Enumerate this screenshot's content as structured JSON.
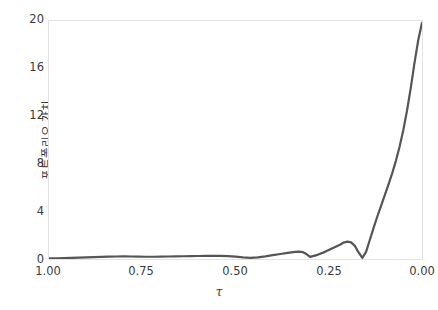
{
  "chart_data": {
    "type": "line",
    "title": "",
    "xlabel": "τ",
    "ylabel": "포트폴리오 가치",
    "xlim": [
      1.0,
      0.0
    ],
    "ylim": [
      0,
      20
    ],
    "x_reversed": true,
    "grid": false,
    "legend": null,
    "line_color": "#555555",
    "axis_color": "#e2e2e2",
    "tick_color": "#3b3b3b",
    "background": "#ffffff",
    "xticks": [
      "1.00",
      "0.75",
      "0.50",
      "0.25",
      "0.00"
    ],
    "xtick_values": [
      1.0,
      0.75,
      0.5,
      0.25,
      0.0
    ],
    "yticks": [
      "0",
      "4",
      "8",
      "12",
      "16",
      "20"
    ],
    "ytick_values": [
      0,
      4,
      8,
      12,
      16,
      20
    ],
    "series": [
      {
        "name": "portfolio-value",
        "x": [
          1.0,
          0.98,
          0.96,
          0.94,
          0.92,
          0.9,
          0.88,
          0.86,
          0.84,
          0.82,
          0.8,
          0.78,
          0.76,
          0.74,
          0.72,
          0.7,
          0.68,
          0.66,
          0.64,
          0.62,
          0.6,
          0.58,
          0.56,
          0.54,
          0.52,
          0.5,
          0.48,
          0.46,
          0.44,
          0.42,
          0.4,
          0.38,
          0.36,
          0.34,
          0.33,
          0.32,
          0.31,
          0.3,
          0.28,
          0.26,
          0.24,
          0.22,
          0.21,
          0.2,
          0.19,
          0.18,
          0.17,
          0.16,
          0.15,
          0.14,
          0.13,
          0.12,
          0.11,
          0.1,
          0.09,
          0.08,
          0.07,
          0.06,
          0.05,
          0.04,
          0.03,
          0.02,
          0.01,
          0.0
        ],
        "y": [
          0.05,
          0.06,
          0.07,
          0.09,
          0.11,
          0.13,
          0.16,
          0.18,
          0.2,
          0.21,
          0.22,
          0.21,
          0.2,
          0.19,
          0.19,
          0.2,
          0.21,
          0.22,
          0.23,
          0.24,
          0.25,
          0.26,
          0.27,
          0.26,
          0.24,
          0.2,
          0.14,
          0.1,
          0.14,
          0.22,
          0.32,
          0.42,
          0.52,
          0.6,
          0.62,
          0.58,
          0.42,
          0.18,
          0.35,
          0.6,
          0.9,
          1.2,
          1.38,
          1.46,
          1.4,
          1.1,
          0.55,
          0.1,
          0.6,
          1.6,
          2.6,
          3.55,
          4.45,
          5.35,
          6.25,
          7.2,
          8.25,
          9.45,
          10.85,
          12.5,
          14.4,
          16.5,
          18.4,
          19.85
        ]
      }
    ]
  },
  "axes": {
    "ylabel_text": "포트폴리오 가치",
    "xlabel_text": "τ"
  }
}
